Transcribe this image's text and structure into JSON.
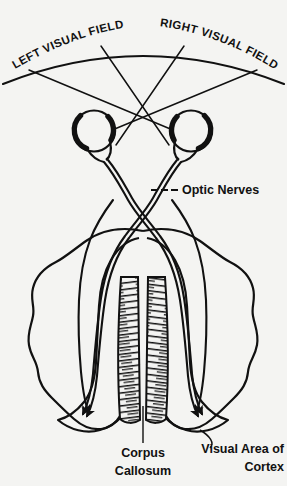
{
  "figure": {
    "background_color": "#f4f4f2",
    "ink_color": "#111111"
  },
  "labels": {
    "left_visual_field": "LEFT VISUAL FIELD",
    "right_visual_field": "RIGHT VISUAL FIELD",
    "optic_nerves": "Optic Nerves",
    "corpus_callosum_line1": "Corpus",
    "corpus_callosum_line2": "Callosum",
    "visual_cortex_line1": "Visual Area of",
    "visual_cortex_line2": "Cortex"
  },
  "structures": {
    "visual_field_arc": "visual-field-arc",
    "sight_lines": "sight-lines",
    "left_eye": "left-eye",
    "right_eye": "right-eye",
    "optic_nerve_left": "optic-nerve-left",
    "optic_nerve_right": "optic-nerve-right",
    "optic_chiasm": "optic-chiasm",
    "brain_outline": "brain-outline",
    "corpus_callosum": "corpus-callosum",
    "occipital_lobe_left": "occipital-lobe-left",
    "occipital_lobe_right": "occipital-lobe-right",
    "tract_arrows": "tract-arrows"
  }
}
